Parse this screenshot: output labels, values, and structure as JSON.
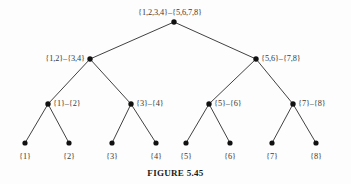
{
  "figure": {
    "caption": "FIGURE 5.45",
    "background_color": "#fdfdfd",
    "line_color": "#2b2b2b",
    "node_color": "#111111",
    "text_color": "#3a3a3a"
  },
  "chart_data": {
    "type": "diagram",
    "diagram_kind": "binary-tree",
    "title": "FIGURE 5.45",
    "levels": 4,
    "nodes": [
      {
        "id": "n0",
        "label": "{1,2,3,4}–{5,6,7,8}",
        "level": 0,
        "x": 174,
        "y": 22,
        "label_x": 170,
        "label_y": 15,
        "label_anchor": "center"
      },
      {
        "id": "n1",
        "label": "{1,2}–{3,4}",
        "level": 1,
        "x": 90,
        "y": 59,
        "label_x": 85,
        "label_y": 61,
        "label_anchor": "left"
      },
      {
        "id": "n2",
        "label": "{5,6}–{7,8}",
        "level": 1,
        "x": 256,
        "y": 59,
        "label_x": 261,
        "label_y": 61,
        "label_anchor": "right"
      },
      {
        "id": "n3",
        "label": "{1}–{2}",
        "level": 2,
        "x": 48,
        "y": 104,
        "label_x": 53,
        "label_y": 106,
        "label_anchor": "right"
      },
      {
        "id": "n4",
        "label": "{3}–{4}",
        "level": 2,
        "x": 131,
        "y": 104,
        "label_x": 136,
        "label_y": 106,
        "label_anchor": "right"
      },
      {
        "id": "n5",
        "label": "{5}–{6}",
        "level": 2,
        "x": 209,
        "y": 104,
        "label_x": 214,
        "label_y": 106,
        "label_anchor": "right"
      },
      {
        "id": "n6",
        "label": "{7}–{8}",
        "level": 2,
        "x": 293,
        "y": 104,
        "label_x": 298,
        "label_y": 106,
        "label_anchor": "right"
      },
      {
        "id": "l1",
        "label": "{1}",
        "level": 3,
        "x": 25,
        "y": 143,
        "label_x": 25,
        "label_y": 159,
        "label_anchor": "center"
      },
      {
        "id": "l2",
        "label": "{2}",
        "level": 3,
        "x": 69,
        "y": 143,
        "label_x": 69,
        "label_y": 159,
        "label_anchor": "center"
      },
      {
        "id": "l3",
        "label": "{3}",
        "level": 3,
        "x": 112,
        "y": 143,
        "label_x": 112,
        "label_y": 159,
        "label_anchor": "center"
      },
      {
        "id": "l4",
        "label": "{4}",
        "level": 3,
        "x": 156,
        "y": 143,
        "label_x": 156,
        "label_y": 159,
        "label_anchor": "center"
      },
      {
        "id": "l5",
        "label": "{5}",
        "level": 3,
        "x": 186,
        "y": 143,
        "label_x": 186,
        "label_y": 159,
        "label_anchor": "center"
      },
      {
        "id": "l6",
        "label": "{6}",
        "level": 3,
        "x": 230,
        "y": 143,
        "label_x": 230,
        "label_y": 159,
        "label_anchor": "center"
      },
      {
        "id": "l7",
        "label": "{7}",
        "level": 3,
        "x": 272,
        "y": 143,
        "label_x": 272,
        "label_y": 159,
        "label_anchor": "center"
      },
      {
        "id": "l8",
        "label": "{8}",
        "level": 3,
        "x": 316,
        "y": 143,
        "label_x": 316,
        "label_y": 159,
        "label_anchor": "center"
      }
    ],
    "edges": [
      {
        "from": "n0",
        "to": "n1"
      },
      {
        "from": "n0",
        "to": "n2"
      },
      {
        "from": "n1",
        "to": "n3"
      },
      {
        "from": "n1",
        "to": "n4"
      },
      {
        "from": "n2",
        "to": "n5"
      },
      {
        "from": "n2",
        "to": "n6"
      },
      {
        "from": "n3",
        "to": "l1"
      },
      {
        "from": "n3",
        "to": "l2"
      },
      {
        "from": "n4",
        "to": "l3"
      },
      {
        "from": "n4",
        "to": "l4"
      },
      {
        "from": "n5",
        "to": "l5"
      },
      {
        "from": "n5",
        "to": "l6"
      },
      {
        "from": "n6",
        "to": "l7"
      },
      {
        "from": "n6",
        "to": "l8"
      }
    ]
  }
}
